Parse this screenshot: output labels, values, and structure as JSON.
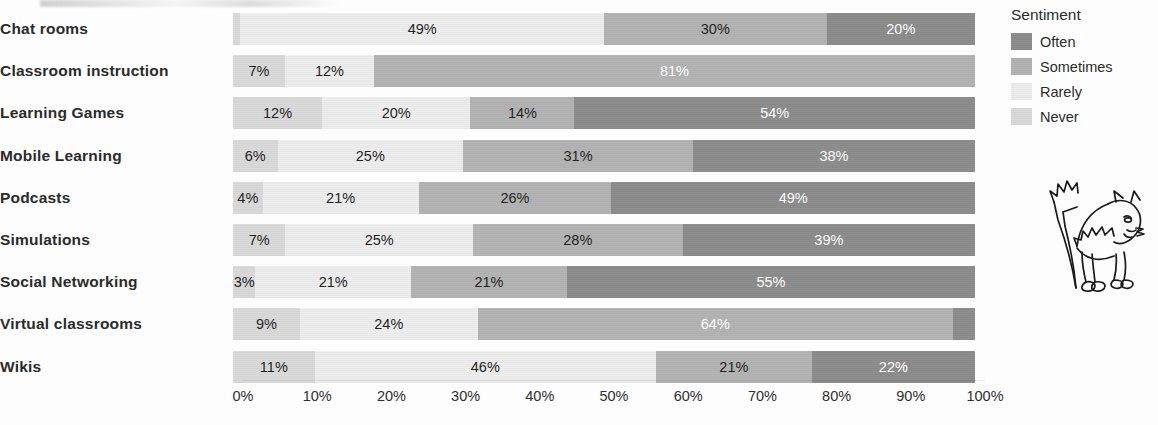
{
  "chart_data": {
    "type": "bar",
    "variant": "stacked-horizontal-100pct",
    "title": "",
    "xlabel": "",
    "ylabel": "",
    "xlim": [
      0,
      100
    ],
    "xticks": [
      "0%",
      "10%",
      "20%",
      "30%",
      "40%",
      "50%",
      "60%",
      "70%",
      "80%",
      "90%",
      "100%"
    ],
    "grid": false,
    "legend_position": "right",
    "legend_title": "Sentiment",
    "categories": [
      "Chat rooms",
      "Classroom instruction",
      "Learning Games",
      "Mobile Learning",
      "Podcasts",
      "Simulations",
      "Social Networking",
      "Virtual classrooms",
      "Wikis"
    ],
    "series": [
      {
        "name": "Never",
        "color": "#d9d9d9",
        "values": [
          1,
          7,
          12,
          6,
          4,
          7,
          3,
          9,
          11
        ]
      },
      {
        "name": "Rarely",
        "color": "#ededed",
        "values": [
          49,
          12,
          20,
          25,
          21,
          25,
          21,
          24,
          46
        ]
      },
      {
        "name": "Sometimes",
        "color": "#b3b3b3",
        "values": [
          30,
          81,
          14,
          31,
          26,
          28,
          21,
          64,
          21
        ]
      },
      {
        "name": "Often",
        "color": "#8c8c8c",
        "values": [
          20,
          0,
          54,
          38,
          49,
          39,
          55,
          3,
          22
        ]
      }
    ],
    "bar_labels": [
      [
        {
          "text": "",
          "pct": 1,
          "series": "Never",
          "shown": false
        },
        {
          "text": "49%",
          "pct": 49,
          "series": "Rarely",
          "shown": true
        },
        {
          "text": "30%",
          "pct": 30,
          "series": "Sometimes",
          "shown": true
        },
        {
          "text": "20%",
          "pct": 20,
          "series": "Often",
          "shown": true
        }
      ],
      [
        {
          "text": "7%",
          "pct": 7,
          "series": "Never",
          "shown": true
        },
        {
          "text": "12%",
          "pct": 12,
          "series": "Rarely",
          "shown": true
        },
        {
          "text": "81%",
          "pct": 81,
          "series": "Sometimes",
          "shown": true
        },
        {
          "text": "",
          "pct": 0,
          "series": "Often",
          "shown": false
        }
      ],
      [
        {
          "text": "12%",
          "pct": 12,
          "series": "Never",
          "shown": true
        },
        {
          "text": "20%",
          "pct": 20,
          "series": "Rarely",
          "shown": true
        },
        {
          "text": "14%",
          "pct": 14,
          "series": "Sometimes",
          "shown": true
        },
        {
          "text": "54%",
          "pct": 54,
          "series": "Often",
          "shown": true
        }
      ],
      [
        {
          "text": "6%",
          "pct": 6,
          "series": "Never",
          "shown": true
        },
        {
          "text": "25%",
          "pct": 25,
          "series": "Rarely",
          "shown": true
        },
        {
          "text": "31%",
          "pct": 31,
          "series": "Sometimes",
          "shown": true
        },
        {
          "text": "38%",
          "pct": 38,
          "series": "Often",
          "shown": true
        }
      ],
      [
        {
          "text": "4%",
          "pct": 4,
          "series": "Never",
          "shown": true
        },
        {
          "text": "21%",
          "pct": 21,
          "series": "Rarely",
          "shown": true
        },
        {
          "text": "26%",
          "pct": 26,
          "series": "Sometimes",
          "shown": true
        },
        {
          "text": "49%",
          "pct": 49,
          "series": "Often",
          "shown": true
        }
      ],
      [
        {
          "text": "7%",
          "pct": 7,
          "series": "Never",
          "shown": true
        },
        {
          "text": "25%",
          "pct": 25,
          "series": "Rarely",
          "shown": true
        },
        {
          "text": "28%",
          "pct": 28,
          "series": "Sometimes",
          "shown": true
        },
        {
          "text": "39%",
          "pct": 39,
          "series": "Often",
          "shown": true
        }
      ],
      [
        {
          "text": "3%",
          "pct": 3,
          "series": "Never",
          "shown": true
        },
        {
          "text": "21%",
          "pct": 21,
          "series": "Rarely",
          "shown": true
        },
        {
          "text": "21%",
          "pct": 21,
          "series": "Sometimes",
          "shown": true
        },
        {
          "text": "55%",
          "pct": 55,
          "series": "Often",
          "shown": true
        }
      ],
      [
        {
          "text": "9%",
          "pct": 9,
          "series": "Never",
          "shown": true
        },
        {
          "text": "24%",
          "pct": 24,
          "series": "Rarely",
          "shown": true
        },
        {
          "text": "64%",
          "pct": 64,
          "series": "Sometimes",
          "shown": true
        },
        {
          "text": "",
          "pct": 3,
          "series": "Often",
          "shown": false
        }
      ],
      [
        {
          "text": "11%",
          "pct": 11,
          "series": "Never",
          "shown": true
        },
        {
          "text": "46%",
          "pct": 46,
          "series": "Rarely",
          "shown": true
        },
        {
          "text": "21%",
          "pct": 21,
          "series": "Sometimes",
          "shown": true
        },
        {
          "text": "22%",
          "pct": 22,
          "series": "Often",
          "shown": true
        }
      ]
    ]
  },
  "legend": {
    "title": "Sentiment",
    "items": [
      {
        "label": "Often",
        "color": "#8c8c8c"
      },
      {
        "label": "Sometimes",
        "color": "#b3b3b3"
      },
      {
        "label": "Rarely",
        "color": "#ededed"
      },
      {
        "label": "Never",
        "color": "#d9d9d9"
      }
    ]
  },
  "decoration": {
    "doodle_name": "cat-drawing",
    "doodle_description": "hand-drawn line art of an arched-back cat with bristled tail"
  }
}
